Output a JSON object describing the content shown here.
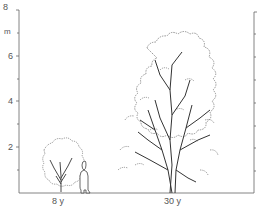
{
  "figure": {
    "axis_unit": "m",
    "y_ticks": [
      "2",
      "4",
      "6",
      "8"
    ],
    "ages": [
      {
        "label": "8 y",
        "height_m": 2.2
      },
      {
        "label": "30 y",
        "height_m": 7.0
      }
    ],
    "scale_figure": "human-silhouette"
  },
  "colors": {
    "line": "#444444",
    "axis": "#555555",
    "background": "#ffffff"
  }
}
